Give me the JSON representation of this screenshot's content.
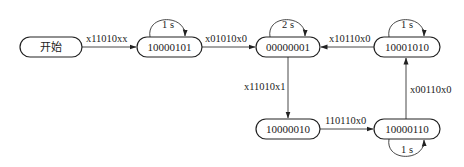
{
  "diagram": {
    "type": "state-machine",
    "nodes": [
      {
        "id": "start",
        "label": "开始"
      },
      {
        "id": "s1",
        "label": "10000101"
      },
      {
        "id": "s2",
        "label": "00000001"
      },
      {
        "id": "s3",
        "label": "10001010"
      },
      {
        "id": "s4",
        "label": "10000010"
      },
      {
        "id": "s5",
        "label": "10000110"
      }
    ],
    "edges": [
      {
        "from": "start",
        "to": "s1",
        "label": "x11010xx"
      },
      {
        "from": "s1",
        "to": "s2",
        "label": "x01010x0"
      },
      {
        "from": "s3",
        "to": "s2",
        "label": "x10110x0"
      },
      {
        "from": "s2",
        "to": "s4",
        "label": "x11010x1"
      },
      {
        "from": "s4",
        "to": "s5",
        "label": "110110x0"
      },
      {
        "from": "s5",
        "to": "s3",
        "label": "x00110x0"
      }
    ],
    "self_loops": [
      {
        "node": "s1",
        "label": "1 s"
      },
      {
        "node": "s2",
        "label": "2 s"
      },
      {
        "node": "s3",
        "label": "1 s"
      },
      {
        "node": "s5",
        "label": "1 s"
      }
    ]
  }
}
